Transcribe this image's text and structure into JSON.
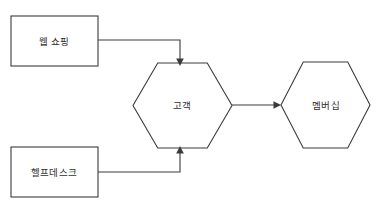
{
  "diagram": {
    "type": "flow-diagram",
    "background_color": "#ffffff",
    "stroke_color": "#3b3b3b",
    "text_color": "#2f2f2f",
    "nodes": [
      {
        "id": "web-shopping",
        "label": "웹 쇼핑",
        "shape": "rectangle",
        "x": 11,
        "y": 16,
        "width": 87,
        "height": 50,
        "label_x": 54,
        "label_y": 41
      },
      {
        "id": "help-desk",
        "label": "헬프데스크",
        "shape": "rectangle",
        "x": 11,
        "y": 147,
        "width": 87,
        "height": 50,
        "label_x": 54,
        "label_y": 172
      },
      {
        "id": "customer",
        "label": "고객",
        "shape": "hexagon",
        "x": 133,
        "y": 63,
        "width": 99,
        "height": 85,
        "label_x": 182,
        "label_y": 105
      },
      {
        "id": "membership",
        "label": "멤버십",
        "shape": "hexagon",
        "x": 281,
        "y": 62,
        "width": 89,
        "height": 86,
        "label_x": 326,
        "label_y": 105
      }
    ],
    "edges": [
      {
        "id": "web-shopping-to-customer",
        "from": "web-shopping",
        "to": "customer",
        "arrow_direction": "down",
        "path": "M 98 40 L 180 40 L 180 60",
        "head": "180,66 176.2,58.5 183.8,58.5"
      },
      {
        "id": "help-desk-to-customer",
        "from": "help-desk",
        "to": "customer",
        "arrow_direction": "up",
        "path": "M 98 172 L 180 172 L 180 152",
        "head": "180,146 176.2,153.5 183.8,153.5"
      },
      {
        "id": "customer-to-membership",
        "from": "customer",
        "to": "membership",
        "arrow_direction": "right",
        "path": "M 232 105 L 275 105",
        "head": "281,105 273.5,101.2 273.5,108.8"
      }
    ]
  }
}
